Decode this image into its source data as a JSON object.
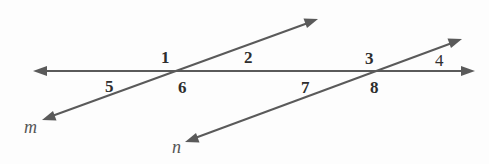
{
  "diagram": {
    "colors": {
      "line": "#5a5a5a",
      "text": "#2e2e2e",
      "italic_text": "#555555",
      "background": "#fdfdfd"
    },
    "lines": {
      "horizontal": {
        "x1": 33,
        "y1": 71,
        "x2": 475,
        "y2": 71,
        "arrows": "both"
      },
      "m": {
        "label": "m",
        "x1": 42,
        "y1": 120,
        "x2": 318,
        "y2": 19,
        "arrows": "both"
      },
      "n": {
        "label": "n",
        "x1": 185,
        "y1": 142,
        "x2": 462,
        "y2": 39,
        "arrows": "both"
      }
    },
    "angle_labels": [
      {
        "id": "1",
        "text": "1",
        "x": 161,
        "y": 63
      },
      {
        "id": "2",
        "text": "2",
        "x": 244,
        "y": 63
      },
      {
        "id": "5",
        "text": "5",
        "x": 105,
        "y": 92
      },
      {
        "id": "6",
        "text": "6",
        "x": 178,
        "y": 93
      },
      {
        "id": "3",
        "text": "3",
        "x": 365,
        "y": 64
      },
      {
        "id": "4",
        "text": "4",
        "x": 435,
        "y": 66
      },
      {
        "id": "7",
        "text": "7",
        "x": 301,
        "y": 93
      },
      {
        "id": "8",
        "text": "8",
        "x": 370,
        "y": 93
      }
    ],
    "line_labels": [
      {
        "id": "m",
        "text": "m",
        "x": 24,
        "y": 133
      },
      {
        "id": "n",
        "text": "n",
        "x": 172,
        "y": 153
      }
    ]
  }
}
